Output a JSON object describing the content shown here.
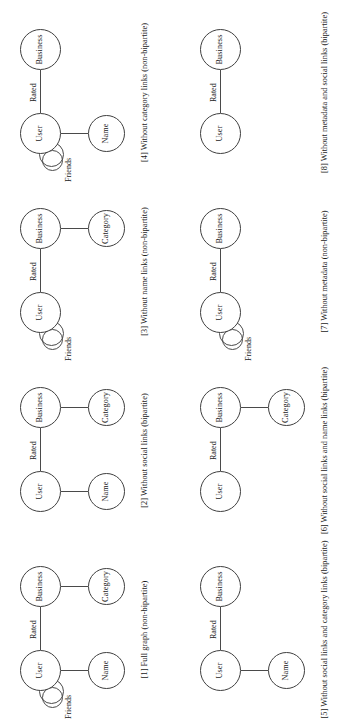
{
  "figure": {
    "orientation": "rotated-90-ccw",
    "columns": 4,
    "rows": 2,
    "node_labels": {
      "user": "User",
      "business": "Business",
      "name": "Name",
      "category": "Category"
    },
    "edge_labels": {
      "rated": "Rated",
      "friends": "Friends"
    },
    "colors": {
      "stroke": "#3f3f3f",
      "edge": "#4a4a4a",
      "text": "#1a1a1a",
      "background": "#ffffff"
    }
  },
  "panels": [
    {
      "id": "panel-1",
      "caption": "[1] Full graph (non-bipartite)",
      "nodes": {
        "user": "User",
        "business": "Business",
        "name": "Name",
        "category": "Category"
      },
      "edges": {
        "rated": "Rated",
        "friends": "Friends",
        "name_link": true,
        "category_link": true
      }
    },
    {
      "id": "panel-2",
      "caption": "[2] Without social links (bipartite)",
      "nodes": {
        "user": "User",
        "business": "Business",
        "name": "Name",
        "category": "Category"
      },
      "edges": {
        "rated": "Rated",
        "friends": null,
        "name_link": true,
        "category_link": true
      }
    },
    {
      "id": "panel-3",
      "caption": "[3] Without name links (non-bipartite)",
      "nodes": {
        "user": "User",
        "business": "Business",
        "name": null,
        "category": "Category"
      },
      "edges": {
        "rated": "Rated",
        "friends": "Friends",
        "name_link": false,
        "category_link": true
      }
    },
    {
      "id": "panel-4",
      "caption": "[4] Without category links (non-bipartite)",
      "nodes": {
        "user": "User",
        "business": "Business",
        "name": "Name",
        "category": null
      },
      "edges": {
        "rated": "Rated",
        "friends": "Friends",
        "name_link": true,
        "category_link": false
      }
    },
    {
      "id": "panel-5",
      "caption": "[5] Without social links and category links (bipartite)",
      "nodes": {
        "user": "User",
        "business": "Business",
        "name": "Name",
        "category": null
      },
      "edges": {
        "rated": "Rated",
        "friends": null,
        "name_link": true,
        "category_link": false
      }
    },
    {
      "id": "panel-6",
      "caption": "[6] Without social links and name links (bipartite)",
      "nodes": {
        "user": "User",
        "business": "Business",
        "name": null,
        "category": "Category"
      },
      "edges": {
        "rated": "Rated",
        "friends": null,
        "name_link": false,
        "category_link": true
      }
    },
    {
      "id": "panel-7",
      "caption": "[7] Without metadata (non-bipartite)",
      "nodes": {
        "user": "User",
        "business": "Business",
        "name": null,
        "category": null
      },
      "edges": {
        "rated": "Rated",
        "friends": "Friends",
        "name_link": false,
        "category_link": false
      }
    },
    {
      "id": "panel-8",
      "caption": "[8] Without metadata and social links (bipartite)",
      "nodes": {
        "user": "User",
        "business": "Business",
        "name": null,
        "category": null
      },
      "edges": {
        "rated": "Rated",
        "friends": null,
        "name_link": false,
        "category_link": false
      }
    }
  ],
  "captions": {
    "p1": "[1] Full graph (non-bipartite)",
    "p2": "[2] Without social links (bipartite)",
    "p3": "[3] Without name links (non-bipartite)",
    "p4": "[4] Without category links (non-bipartite)",
    "p5": "[5] Without social links and category links (bipartite)",
    "p6": "[6] Without social links and name links (bipartite)",
    "p7": "[7] Without metadata (non-bipartite)",
    "p8": "[8] Without metadata and social links (bipartite)"
  }
}
